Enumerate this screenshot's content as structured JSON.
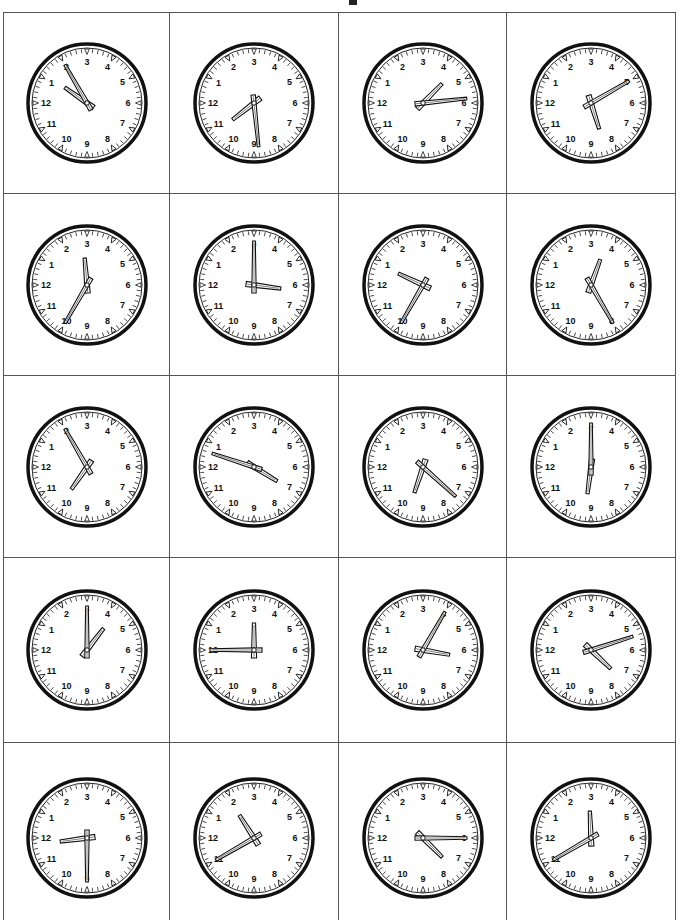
{
  "worksheet": {
    "rotation_deg": -90,
    "clocks": [
      {
        "row": 1,
        "col": 1,
        "time": "1:10",
        "hour": 1,
        "minute": 10
      },
      {
        "row": 1,
        "col": 2,
        "time": "10:44",
        "hour": 10,
        "minute": 44
      },
      {
        "row": 1,
        "col": 3,
        "time": "4:29",
        "hour": 4,
        "minute": 29
      },
      {
        "row": 1,
        "col": 4,
        "time": "8:25",
        "hour": 8,
        "minute": 25
      },
      {
        "row": 2,
        "col": 1,
        "time": "2:50",
        "hour": 2,
        "minute": 50
      },
      {
        "row": 2,
        "col": 2,
        "time": "6:15",
        "hour": 6,
        "minute": 15
      },
      {
        "row": 2,
        "col": 3,
        "time": "12:50",
        "hour": 12,
        "minute": 50
      },
      {
        "row": 2,
        "col": 4,
        "time": "3:40",
        "hour": 3,
        "minute": 40
      },
      {
        "row": 3,
        "col": 1,
        "time": "10:10",
        "hour": 10,
        "minute": 10
      },
      {
        "row": 3,
        "col": 2,
        "time": "7:03",
        "hour": 7,
        "minute": 3
      },
      {
        "row": 3,
        "col": 3,
        "time": "9:37",
        "hour": 9,
        "minute": 37
      },
      {
        "row": 3,
        "col": 4,
        "time": "9:15",
        "hour": 9,
        "minute": 15
      },
      {
        "row": 4,
        "col": 1,
        "time": "4:15",
        "hour": 4,
        "minute": 15
      },
      {
        "row": 4,
        "col": 2,
        "time": "3:00",
        "hour": 3,
        "minute": 0
      },
      {
        "row": 4,
        "col": 3,
        "time": "6:20",
        "hour": 6,
        "minute": 20
      },
      {
        "row": 4,
        "col": 4,
        "time": "7:27",
        "hour": 7,
        "minute": 27
      },
      {
        "row": 5,
        "col": 1,
        "time": "11:45",
        "hour": 11,
        "minute": 45
      },
      {
        "row": 5,
        "col": 2,
        "time": "1:55",
        "hour": 1,
        "minute": 55
      },
      {
        "row": 5,
        "col": 3,
        "time": "7:30",
        "hour": 7,
        "minute": 30
      },
      {
        "row": 5,
        "col": 4,
        "time": "2:55",
        "hour": 2,
        "minute": 55
      }
    ],
    "numerals": [
      "12",
      "1",
      "2",
      "3",
      "4",
      "5",
      "6",
      "7",
      "8",
      "9",
      "10",
      "11"
    ]
  }
}
